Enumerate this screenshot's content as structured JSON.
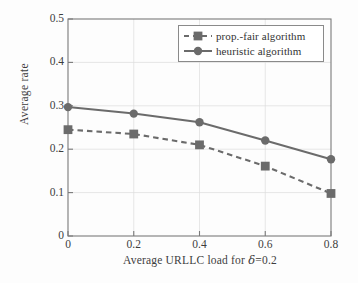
{
  "chart_data": {
    "type": "line",
    "title": "",
    "subtitle": "",
    "xlabel": "Average URLLC load for δ=0.2",
    "xlabel_prefix": "Average URLLC load for ",
    "xlabel_symbol": "δ",
    "xlabel_suffix": "=0.2",
    "ylabel": "Average rate",
    "x": [
      0,
      0.2,
      0.4,
      0.6,
      0.8
    ],
    "xlim": [
      0,
      0.8
    ],
    "ylim": [
      0,
      0.5
    ],
    "xticks": [
      "0",
      "0.2",
      "0.4",
      "0.6",
      "0.8"
    ],
    "yticks": [
      "0",
      "0.1",
      "0.2",
      "0.3",
      "0.4",
      "0.5"
    ],
    "xtick_values": [
      0,
      0.2,
      0.4,
      0.6,
      0.8
    ],
    "ytick_values": [
      0,
      0.1,
      0.2,
      0.3,
      0.4,
      0.5
    ],
    "grid": true,
    "grid_color": "#dcdcdc",
    "legend_position": "top-right",
    "series": [
      {
        "name": "prop.-fair algorithm",
        "values": [
          0.245,
          0.235,
          0.21,
          0.161,
          0.098
        ],
        "line_style": "dashed",
        "marker": "square",
        "color": "#6b6b6b"
      },
      {
        "name": "heuristic algorithm",
        "values": [
          0.297,
          0.282,
          0.262,
          0.22,
          0.177
        ],
        "line_style": "solid",
        "marker": "circle",
        "color": "#6b6b6b"
      }
    ]
  },
  "legend": {
    "items": [
      {
        "label": "prop.-fair algorithm"
      },
      {
        "label": "heuristic algorithm"
      }
    ]
  },
  "colors": {
    "axis": "#7a7a7a",
    "series": "#6b6b6b",
    "grid": "#dcdcdc",
    "text": "#3d3d3d",
    "background": "#fdfdfd"
  }
}
